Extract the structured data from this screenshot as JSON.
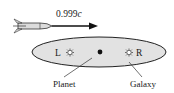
{
  "diagram": {
    "rocket": {
      "speed_label_prefix": "0.999",
      "speed_label_unit": "c"
    },
    "galaxy": {
      "label": "Galaxy",
      "fill_color": "#e2e2e2",
      "stroke_color": "#222222"
    },
    "planet": {
      "label": "Planet"
    },
    "stars": {
      "left_label": "L",
      "right_label": "R"
    }
  }
}
